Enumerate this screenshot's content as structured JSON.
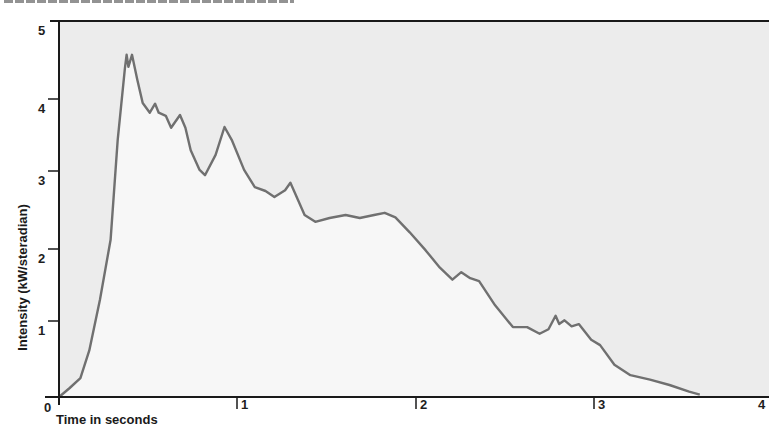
{
  "chart_data": {
    "type": "area",
    "title": "",
    "xlabel": "Time in seconds",
    "ylabel": "Intensity (kW/steradian)",
    "xlim": [
      0,
      4
    ],
    "ylim": [
      0,
      5
    ],
    "x_ticks": [
      "0",
      "1",
      "2",
      "3",
      "4"
    ],
    "y_ticks": [
      "0",
      "1",
      "2",
      "3",
      "4",
      "5"
    ],
    "grid": false,
    "legend": null,
    "series": [
      {
        "name": "Intensity",
        "x": [
          0.0,
          0.02,
          0.06,
          0.12,
          0.17,
          0.23,
          0.29,
          0.33,
          0.37,
          0.38,
          0.39,
          0.41,
          0.44,
          0.47,
          0.51,
          0.54,
          0.56,
          0.6,
          0.63,
          0.68,
          0.71,
          0.74,
          0.79,
          0.82,
          0.88,
          0.93,
          0.97,
          1.04,
          1.1,
          1.16,
          1.21,
          1.27,
          1.3,
          1.33,
          1.38,
          1.44,
          1.52,
          1.61,
          1.69,
          1.77,
          1.83,
          1.89,
          1.97,
          2.06,
          2.14,
          2.21,
          2.26,
          2.31,
          2.36,
          2.45,
          2.55,
          2.63,
          2.7,
          2.75,
          2.79,
          2.81,
          2.84,
          2.88,
          2.92,
          2.99,
          3.04,
          3.12,
          3.21,
          3.32,
          3.43,
          3.54,
          3.6
        ],
        "values": [
          0.0,
          0.04,
          0.12,
          0.25,
          0.62,
          1.29,
          2.09,
          3.42,
          4.37,
          4.55,
          4.39,
          4.55,
          4.22,
          3.91,
          3.78,
          3.9,
          3.78,
          3.74,
          3.58,
          3.75,
          3.58,
          3.28,
          3.02,
          2.95,
          3.22,
          3.59,
          3.42,
          3.02,
          2.79,
          2.74,
          2.66,
          2.75,
          2.85,
          2.69,
          2.42,
          2.33,
          2.38,
          2.42,
          2.38,
          2.42,
          2.45,
          2.39,
          2.19,
          1.95,
          1.72,
          1.56,
          1.66,
          1.58,
          1.54,
          1.22,
          0.93,
          0.93,
          0.84,
          0.9,
          1.08,
          0.97,
          1.02,
          0.94,
          0.97,
          0.76,
          0.69,
          0.43,
          0.29,
          0.23,
          0.16,
          0.07,
          0.03
        ]
      }
    ],
    "colors": {
      "line": "#707070",
      "fill_under": "#f7f7f7",
      "background": "#ececec",
      "axis": "#1a1a1a"
    },
    "plot_px": {
      "x0": 59,
      "y0": 397,
      "px_per_x": 178,
      "px_per_y": 75.2
    }
  },
  "labels": {
    "y_axis_title": "Intensity (kW/steradian)",
    "x_axis_title": "Time in seconds",
    "x_tick_0": "0",
    "x_tick_1": "1",
    "x_tick_2": "2",
    "x_tick_3": "3",
    "x_tick_4": "4",
    "y_tick_1": "1",
    "y_tick_2": "2",
    "y_tick_3": "3",
    "y_tick_4": "4",
    "y_tick_5": "5"
  }
}
